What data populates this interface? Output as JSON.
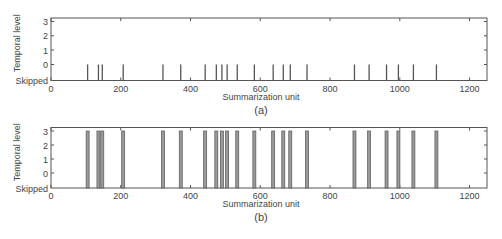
{
  "chart_data": [
    {
      "type": "bar",
      "subtitle": "(a)",
      "xlabel": "Summarization unit",
      "ylabel": "Temporal level",
      "xlim": [
        0,
        1250
      ],
      "xticks": [
        0,
        200,
        400,
        600,
        800,
        1000,
        1200
      ],
      "yticks": [
        "Skipped",
        "0",
        "1",
        "2",
        "3"
      ],
      "grid": false,
      "x": [
        105,
        136,
        147,
        207,
        321,
        372,
        442,
        474,
        490,
        505,
        534,
        583,
        637,
        666,
        686,
        734,
        870,
        912,
        962,
        996,
        1039,
        1105
      ],
      "values": [
        0,
        0,
        0,
        0,
        0,
        0,
        0,
        0,
        0,
        0,
        0,
        0,
        0,
        0,
        0,
        0,
        0,
        0,
        0,
        0,
        0,
        0
      ],
      "style": "stem"
    },
    {
      "type": "bar",
      "subtitle": "(b)",
      "xlabel": "Summarization unit",
      "ylabel": "Temporal level",
      "xlim": [
        0,
        1250
      ],
      "xticks": [
        0,
        200,
        400,
        600,
        800,
        1000,
        1200
      ],
      "yticks": [
        "Skipped",
        "0",
        "1",
        "2",
        "3"
      ],
      "grid": false,
      "x": [
        105,
        136,
        147,
        207,
        321,
        372,
        442,
        474,
        490,
        505,
        534,
        583,
        637,
        666,
        686,
        734,
        870,
        912,
        962,
        996,
        1039,
        1105
      ],
      "values": [
        3,
        3,
        3,
        3,
        3,
        3,
        3,
        3,
        3,
        3,
        3,
        3,
        3,
        3,
        3,
        3,
        3,
        3,
        3,
        3,
        3,
        3
      ],
      "style": "bar"
    }
  ],
  "colors": {
    "axis": "#555555",
    "stem": "#555555",
    "bar_fill": "#9a9a9a",
    "bar_edge": "#555555"
  }
}
